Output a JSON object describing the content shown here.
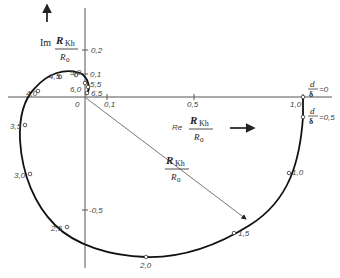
{
  "diagram": {
    "type": "nyquist-locus",
    "axes": {
      "imag_label_prefix": "Im",
      "real_label_prefix": "Re",
      "fraction_num": "R",
      "fraction_num_sub": "Kh",
      "fraction_den": "R",
      "fraction_den_sub": "0",
      "origin_label": "0",
      "real_ticks": [
        "0,1",
        "0,5",
        "1,0"
      ],
      "imag_ticks": [
        "0,2",
        "0,1",
        "-0,5"
      ]
    },
    "curve_points": [
      {
        "label": "6,5"
      },
      {
        "label": "6,0"
      },
      {
        "label": "5,5"
      },
      {
        "label": "5,0"
      },
      {
        "label": "4,5"
      },
      {
        "label": "4,0"
      },
      {
        "label": "3,5"
      },
      {
        "label": "3,0"
      },
      {
        "label": "2,5"
      },
      {
        "label": "2,0"
      },
      {
        "label": "1,5"
      },
      {
        "label": "1,0"
      }
    ],
    "annotations": {
      "d_delta_0": {
        "num": "d",
        "den": "δ",
        "value": "=0"
      },
      "d_delta_05": {
        "num": "d",
        "den": "δ",
        "value": "=0,5"
      },
      "vector_label_num": "R",
      "vector_label_num_sub": "Kh",
      "vector_label_den": "R",
      "vector_label_den_sub": "0"
    }
  }
}
